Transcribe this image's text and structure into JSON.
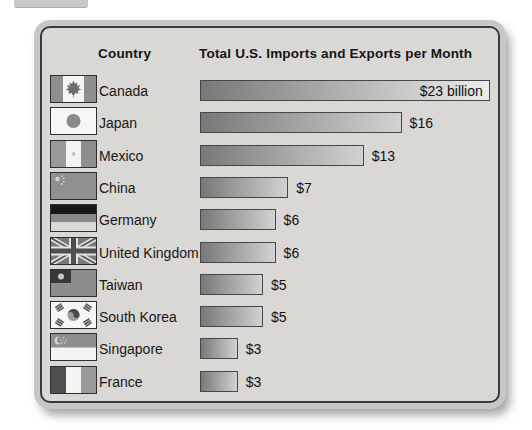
{
  "page": {
    "description_fragment": "cropped-gray-tab"
  },
  "header": {
    "country_column_label": "Country",
    "chart_title": "Total U.S. Imports and Exports per Month"
  },
  "chart_data": {
    "type": "bar",
    "orientation": "horizontal",
    "title": "Total U.S. Imports and Exports per Month",
    "unit": "billions of U.S. dollars per month",
    "categories": [
      "Canada",
      "Japan",
      "Mexico",
      "China",
      "Germany",
      "United Kingdom",
      "Taiwan",
      "South Korea",
      "Singapore",
      "France"
    ],
    "values": [
      23,
      16,
      13,
      7,
      6,
      6,
      5,
      5,
      3,
      3
    ],
    "rows": [
      {
        "country": "Canada",
        "value": 23,
        "label": "$23 billion",
        "flag_icon": "canada-flag-icon",
        "label_inside_bar": true
      },
      {
        "country": "Japan",
        "value": 16,
        "label": "$16",
        "flag_icon": "japan-flag-icon",
        "label_inside_bar": false
      },
      {
        "country": "Mexico",
        "value": 13,
        "label": "$13",
        "flag_icon": "mexico-flag-icon",
        "label_inside_bar": false
      },
      {
        "country": "China",
        "value": 7,
        "label": "$7",
        "flag_icon": "china-flag-icon",
        "label_inside_bar": false
      },
      {
        "country": "Germany",
        "value": 6,
        "label": "$6",
        "flag_icon": "germany-flag-icon",
        "label_inside_bar": false
      },
      {
        "country": "United Kingdom",
        "value": 6,
        "label": "$6",
        "flag_icon": "united-kingdom-flag-icon",
        "label_inside_bar": false
      },
      {
        "country": "Taiwan",
        "value": 5,
        "label": "$5",
        "flag_icon": "taiwan-flag-icon",
        "label_inside_bar": false
      },
      {
        "country": "South Korea",
        "value": 5,
        "label": "$5",
        "flag_icon": "south-korea-flag-icon",
        "label_inside_bar": false
      },
      {
        "country": "Singapore",
        "value": 3,
        "label": "$3",
        "flag_icon": "singapore-flag-icon",
        "label_inside_bar": false
      },
      {
        "country": "France",
        "value": 3,
        "label": "$3",
        "flag_icon": "france-flag-icon",
        "label_inside_bar": false
      }
    ],
    "px_per_billion": 12.6,
    "bar_color_start": "#787878",
    "bar_color_end": "#d2d2d2",
    "bar_color_end_first_row": "#ececec",
    "legend": "none",
    "grid": "off",
    "xlim": [
      0,
      24
    ]
  },
  "colors": {
    "panel_background": "#d9d8d4",
    "panel_border": "#3a3a3a",
    "panel_shadow_ring": "#c7c7c7",
    "text": "#141414",
    "bar_border": "#474747"
  }
}
